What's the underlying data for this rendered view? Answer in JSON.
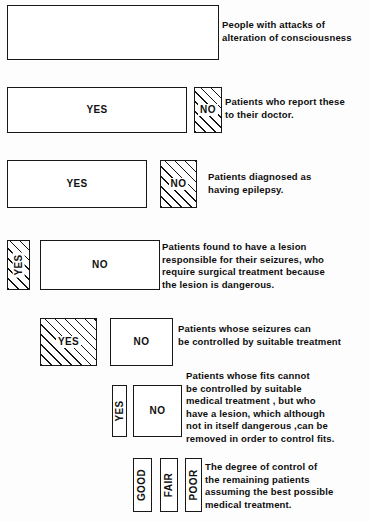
{
  "diagram": {
    "background_color": "#fdfdfd",
    "line_color": "#181818",
    "fill_color": "#ffffff",
    "hatch_color": "#151515",
    "labels": {
      "yes": "YES",
      "no": "NO",
      "good": "GOOD",
      "fair": "FAIR",
      "poor": "POOR"
    },
    "rows": [
      {
        "id": "row-1",
        "caption": "People with attacks of\nalteration of consciousness",
        "boxes": [
          {
            "name": "total-population-box",
            "label": "",
            "hatched": false,
            "vertical": false
          }
        ]
      },
      {
        "id": "row-2",
        "caption": "Patients who report these\nto their doctor.",
        "boxes": [
          {
            "name": "reported-yes-box",
            "label": "YES",
            "hatched": false,
            "vertical": false
          },
          {
            "name": "reported-no-box",
            "label": "NO",
            "hatched": true,
            "vertical": false
          }
        ]
      },
      {
        "id": "row-3",
        "caption": "Patients diagnosed as\nhaving epilepsy.",
        "boxes": [
          {
            "name": "diagnosed-yes-box",
            "label": "YES",
            "hatched": false,
            "vertical": false
          },
          {
            "name": "diagnosed-no-box",
            "label": "NO",
            "hatched": true,
            "vertical": false
          }
        ]
      },
      {
        "id": "row-4",
        "caption": "Patients found to have a lesion\nresponsible for their seizures, who\nrequire surgical treatment because\nthe lesion is dangerous.",
        "boxes": [
          {
            "name": "dangerous-lesion-yes-box",
            "label": "YES",
            "hatched": true,
            "vertical": true
          },
          {
            "name": "dangerous-lesion-no-box",
            "label": "NO",
            "hatched": false,
            "vertical": false
          }
        ]
      },
      {
        "id": "row-5",
        "caption": "Patients whose seizures can\nbe controlled by suitable treatment",
        "boxes": [
          {
            "name": "controlled-yes-box",
            "label": "YES",
            "hatched": true,
            "vertical": false
          },
          {
            "name": "controlled-no-box",
            "label": "NO",
            "hatched": false,
            "vertical": false
          }
        ]
      },
      {
        "id": "row-6",
        "caption": "Patients whose fits cannot\nbe controlled by suitable\nmedical treatment , but who\nhave a lesion, which although\nnot in itself dangerous ,can be\nremoved in order to control fits.",
        "boxes": [
          {
            "name": "removable-lesion-yes-box",
            "label": "YES",
            "hatched": false,
            "vertical": true
          },
          {
            "name": "removable-lesion-no-box",
            "label": "NO",
            "hatched": false,
            "vertical": false
          }
        ]
      },
      {
        "id": "row-7",
        "caption": "The degree of control of\nthe remaining patients\nassuming the best possible\nmedical treatment.",
        "boxes": [
          {
            "name": "control-good-box",
            "label": "GOOD",
            "hatched": false,
            "vertical": true
          },
          {
            "name": "control-fair-box",
            "label": "FAIR",
            "hatched": false,
            "vertical": true
          },
          {
            "name": "control-poor-box",
            "label": "POOR",
            "hatched": false,
            "vertical": true
          }
        ]
      }
    ]
  }
}
